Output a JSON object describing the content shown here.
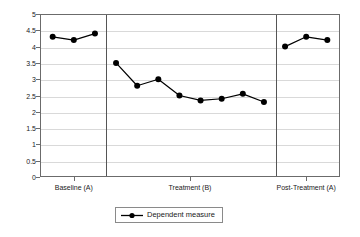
{
  "chart_data": {
    "type": "line",
    "title": "",
    "subtitle": "",
    "xlabel": "",
    "ylabel": "",
    "ylim": [
      0,
      5
    ],
    "grid": true,
    "legend_position": "bottom",
    "y_ticks": [
      "0",
      "0.5",
      "1",
      "1.5",
      "2",
      "2.5",
      "3",
      "3.5",
      "4",
      "4.5",
      "5"
    ],
    "y_tick_values": [
      0,
      0.5,
      1,
      1.5,
      2,
      2.5,
      3,
      3.5,
      4,
      4.5,
      5
    ],
    "x_tick_labels": [
      "Baseline (A)",
      "Treatment (B)",
      "Post-Treatment (A)"
    ],
    "phases": [
      {
        "name": "Baseline (A)",
        "sessions": [
          1,
          2,
          3
        ],
        "values": [
          4.3,
          4.2,
          4.4
        ]
      },
      {
        "name": "Treatment (B)",
        "sessions": [
          4,
          5,
          6,
          7,
          8,
          9,
          10,
          11
        ],
        "values": [
          3.5,
          2.8,
          3.0,
          2.5,
          2.35,
          2.4,
          2.55,
          2.3
        ]
      },
      {
        "name": "Post-Treatment (A)",
        "sessions": [
          12,
          13,
          14
        ],
        "values": [
          4.0,
          4.3,
          4.2
        ]
      }
    ],
    "series": [
      {
        "name": "Dependent measure",
        "color": "#000000",
        "x": [
          1,
          2,
          3,
          4,
          5,
          6,
          7,
          8,
          9,
          10,
          11,
          12,
          13,
          14
        ],
        "values": [
          4.3,
          4.2,
          4.4,
          3.5,
          2.8,
          3.0,
          2.5,
          2.35,
          2.4,
          2.55,
          2.3,
          4.0,
          4.3,
          4.2
        ]
      }
    ],
    "phase_divider_x": [
      3.5,
      11.5
    ],
    "annotations": []
  },
  "legend": {
    "entries": [
      {
        "label": "Dependent measure",
        "marker": "filled-circle-with-line"
      }
    ]
  },
  "colors": {
    "series": "#000000",
    "grid": "#d9d9d9",
    "axis": "#6b6b6b",
    "divider": "#555555",
    "text": "#1a1a1a",
    "background": "#ffffff"
  }
}
